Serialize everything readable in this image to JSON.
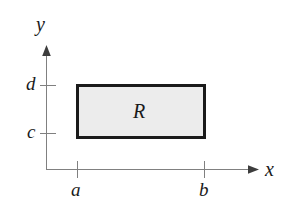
{
  "figure": {
    "kind": "coordinate-plane-diagram",
    "canvas": {
      "width": 293,
      "height": 213,
      "background": "#ffffff"
    },
    "axes": {
      "line_color": "#808080",
      "line_width": 1,
      "arrow_color": "#4d4d4d",
      "x_axis": {
        "label": "x",
        "label_position": {
          "x": 265,
          "y": 159
        },
        "start": {
          "x": 46,
          "y": 169
        },
        "end": {
          "x": 258,
          "y": 169
        },
        "ticks": [
          {
            "label": "a",
            "x": 77,
            "label_position": {
              "x": 71,
              "y": 180
            }
          },
          {
            "label": "b",
            "x": 205,
            "label_position": {
              "x": 199,
              "y": 180
            }
          }
        ]
      },
      "y_axis": {
        "label": "y",
        "label_position": {
          "x": 36,
          "y": 14
        },
        "start": {
          "x": 46,
          "y": 169
        },
        "end": {
          "x": 46,
          "y": 48
        },
        "ticks": [
          {
            "label": "d",
            "y": 85,
            "label_position": {
              "x": 26,
              "y": 74
            }
          },
          {
            "label": "c",
            "y": 133,
            "label_position": {
              "x": 27,
              "y": 122
            }
          }
        ]
      }
    },
    "region": {
      "label": "R",
      "label_position": {
        "x": 133,
        "y": 101
      },
      "fill_color": "#ececec",
      "stroke_color": "#1a1a1a",
      "stroke_width": 3,
      "left": 76,
      "top": 84,
      "right": 205,
      "bottom": 138,
      "x_range": [
        "a",
        "b"
      ],
      "y_range": [
        "c",
        "d"
      ]
    }
  }
}
